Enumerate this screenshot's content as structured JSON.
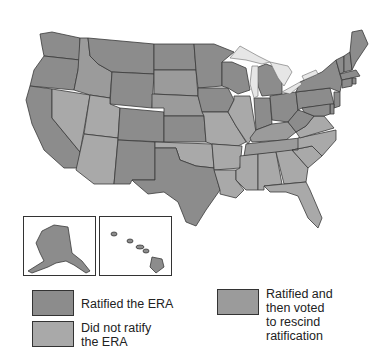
{
  "colors": {
    "ratified": "#8c8c8c",
    "not_ratified": "#a9a9a9",
    "rescinded": "#9b9b9b",
    "lake": "#e6e6e6",
    "border": "#3a3a3a"
  },
  "legend": {
    "items": [
      {
        "key": "ratified",
        "label_lines": [
          "Ratified the ERA"
        ]
      },
      {
        "key": "not_ratified",
        "label_lines": [
          "Did not ratify",
          "the ERA"
        ]
      },
      {
        "key": "rescinded",
        "label_lines": [
          "Ratified and",
          "then voted",
          "to rescind",
          "ratification"
        ]
      }
    ]
  },
  "insets": [
    {
      "name": "Alaska",
      "status": "ratified"
    },
    {
      "name": "Hawaii",
      "status": "ratified"
    }
  ],
  "states": {
    "WA": "ratified",
    "OR": "ratified",
    "CA": "ratified",
    "ID": "rescinded",
    "NV": "not_ratified",
    "MT": "ratified",
    "WY": "ratified",
    "UT": "not_ratified",
    "AZ": "not_ratified",
    "CO": "ratified",
    "NM": "ratified",
    "ND": "ratified",
    "SD": "rescinded",
    "NE": "rescinded",
    "KS": "ratified",
    "OK": "not_ratified",
    "TX": "ratified",
    "MN": "ratified",
    "IA": "ratified",
    "MO": "not_ratified",
    "AR": "not_ratified",
    "LA": "not_ratified",
    "WI": "ratified",
    "IL": "not_ratified",
    "MI": "ratified",
    "IN": "ratified",
    "OH": "ratified",
    "KY": "rescinded",
    "TN": "rescinded",
    "MS": "not_ratified",
    "AL": "not_ratified",
    "GA": "not_ratified",
    "FL": "not_ratified",
    "SC": "not_ratified",
    "NC": "not_ratified",
    "VA": "not_ratified",
    "WV": "ratified",
    "PA": "ratified",
    "NY": "ratified",
    "VT": "ratified",
    "NH": "ratified",
    "ME": "ratified",
    "MA": "ratified",
    "RI": "ratified",
    "CT": "ratified",
    "NJ": "ratified",
    "DE": "ratified",
    "MD": "ratified",
    "AK": "ratified",
    "HI": "ratified"
  }
}
